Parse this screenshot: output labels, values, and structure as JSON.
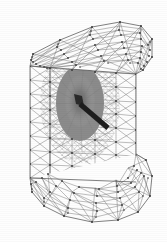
{
  "figure": {
    "kind": "3d-finite-element-mesh",
    "title": "",
    "caption": "",
    "background_color": "#fefefe",
    "edge_color": "#6e6e6e",
    "outline_color": "#555555",
    "node_color": "#3a3a3a",
    "refined_zone_color": "#8b8b8b",
    "crack_color": "#1d1d1d",
    "view": "perspective",
    "element_type": "triangular-surface-of-tetrahedral-mesh",
    "annotations": [],
    "labels": [],
    "axis_labels": [],
    "legend": []
  },
  "chart_data": {
    "type": "mesh",
    "title": "",
    "xlabel": "",
    "ylabel": "",
    "xlim": [
      0,
      167
    ],
    "ylim": [
      0,
      242
    ],
    "grid": false,
    "legend_position": "none",
    "body_outline": [
      [
        30,
        66
      ],
      [
        33,
        54
      ],
      [
        60,
        40
      ],
      [
        96,
        26
      ],
      [
        124,
        22
      ],
      [
        142,
        26
      ],
      [
        152,
        38
      ],
      [
        152,
        56
      ],
      [
        144,
        70
      ],
      [
        136,
        74
      ],
      [
        136,
        154
      ],
      [
        146,
        160
      ],
      [
        152,
        176
      ],
      [
        150,
        196
      ],
      [
        138,
        212
      ],
      [
        118,
        220
      ],
      [
        92,
        222
      ],
      [
        64,
        216
      ],
      [
        44,
        206
      ],
      [
        32,
        192
      ],
      [
        30,
        178
      ]
    ],
    "front_face_outline": [
      [
        30,
        66
      ],
      [
        136,
        74
      ],
      [
        136,
        154
      ],
      [
        30,
        178
      ]
    ],
    "vertical_fold_edges": [
      {
        "name": "left-silhouette-edge",
        "x1": 30,
        "y1": 66,
        "x2": 30,
        "y2": 178
      },
      {
        "name": "inner-fold-edge",
        "x1": 50,
        "y1": 68,
        "x2": 50,
        "y2": 196
      },
      {
        "name": "right-fold-edge",
        "x1": 136,
        "y1": 74,
        "x2": 136,
        "y2": 156
      }
    ],
    "refinement_zone": {
      "shape": "ellipse",
      "center": [
        80,
        103
      ],
      "rx": 24,
      "ry": 38,
      "grading": "radial, finest at center"
    },
    "crack": {
      "shape": "planar-bar",
      "start": [
        80,
        104
      ],
      "end": [
        108,
        128
      ],
      "width_px": 5,
      "color": "#1d1d1d"
    },
    "mesh_statistics": {
      "coarse_edge_length_px": 16,
      "fine_edge_length_px": 2
    }
  }
}
